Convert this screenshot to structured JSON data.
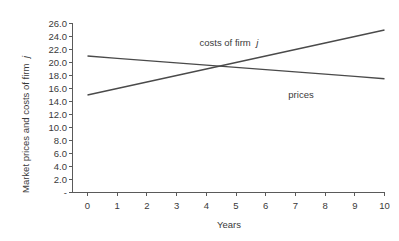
{
  "chart_data": {
    "type": "line",
    "title": "",
    "xlabel": "Years",
    "ylabel": "Market prices and costs of firm j",
    "ylabel_plain": "Market prices and costs of firm",
    "ylabel_italic": "j",
    "x": [
      0,
      1,
      2,
      3,
      4,
      5,
      6,
      7,
      8,
      9,
      10
    ],
    "xlim": [
      0,
      10
    ],
    "ylim": [
      0,
      26
    ],
    "grid": false,
    "legend_position": "inline-annotations",
    "xtick_labels": [
      "0",
      "1",
      "2",
      "3",
      "4",
      "5",
      "6",
      "7",
      "8",
      "9",
      "10"
    ],
    "ytick_labels": [
      "-",
      "2.0",
      "4.0",
      "6.0",
      "8.0",
      "10.0",
      "12.0",
      "14.0",
      "16.0",
      "18.0",
      "20.0",
      "22.0",
      "24.0",
      "26.0"
    ],
    "ytick_values": [
      0,
      2,
      4,
      6,
      8,
      10,
      12,
      14,
      16,
      18,
      20,
      22,
      24,
      26
    ],
    "series": [
      {
        "name": "costs of firm j",
        "label_plain": "costs of firm",
        "label_italic": "j",
        "values": [
          15.0,
          16.0,
          17.0,
          18.0,
          19.0,
          20.0,
          21.0,
          22.0,
          23.0,
          24.0,
          25.0
        ],
        "color": "#4a4a4a"
      },
      {
        "name": "prices",
        "label_plain": "prices",
        "label_italic": "",
        "values": [
          21.0,
          20.65,
          20.3,
          19.95,
          19.6,
          19.25,
          18.9,
          18.55,
          18.2,
          17.85,
          17.5
        ],
        "color": "#4a4a4a"
      }
    ],
    "annotations": [
      {
        "text": "costs of firm j",
        "x_px": 229,
        "y_px": 46
      },
      {
        "text": "prices",
        "x_px": 301,
        "y_px": 98
      }
    ],
    "colors": {
      "line": "#4a4a4a",
      "axis": "#5a5a5a",
      "text": "#3a3a3a",
      "background": "#ffffff"
    }
  }
}
